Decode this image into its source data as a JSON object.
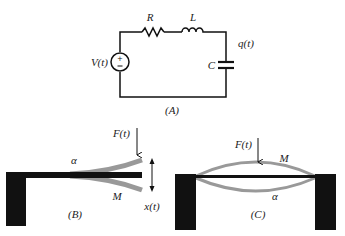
{
  "panels": {
    "A": {
      "caption": "(A)",
      "source_label": "V(t)",
      "resistor_label": "R",
      "inductor_label": "L",
      "capacitor_label": "C",
      "charge_label": "q(t)"
    },
    "B": {
      "caption": "(B)",
      "force_label": "F(t)",
      "alpha_label": "α",
      "mass_label": "M",
      "displacement_label": "x(t)"
    },
    "C": {
      "caption": "(C)",
      "force_label": "F(t)",
      "mass_label": "M",
      "alpha_label": "α"
    }
  },
  "colors": {
    "ink": "#111111",
    "beam_deflection": "#999999"
  }
}
